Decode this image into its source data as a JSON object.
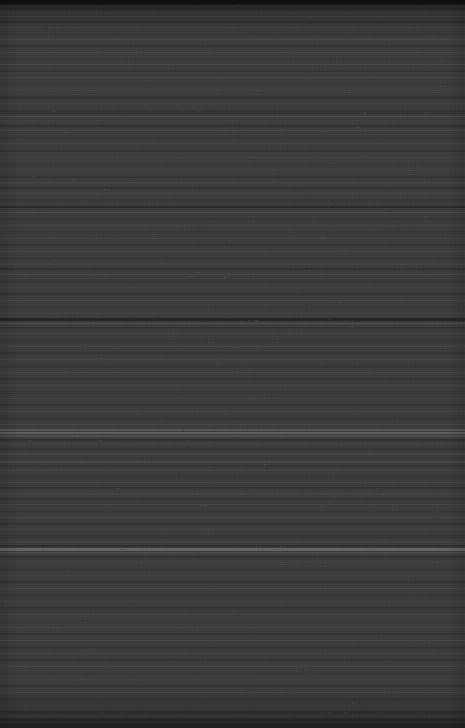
{
  "capture": {
    "width": 465,
    "height": 728,
    "orientation": "portrait",
    "content_state": "no-legible-content",
    "description": "Dark charcoal screen capture with horizontal scanline banding and no discernible user interface elements, text, or icons.",
    "base_color": "#3a3a3a",
    "darkest_color": "#1e1e1e",
    "brightest_color": "#6a6a6a",
    "top_bar_color": "#161616",
    "top_bar_height": 4,
    "artifact_type": "horizontal-banding-noise"
  },
  "bands": [
    {
      "top": 0,
      "height": 5,
      "color": "#1a1a1a",
      "opacity": 1.0
    },
    {
      "top": 5,
      "height": 3,
      "color": "#343434",
      "opacity": 1.0
    },
    {
      "top": 8,
      "height": 2,
      "color": "#2b2b2b",
      "opacity": 0.9
    },
    {
      "top": 12,
      "height": 2,
      "color": "#444444",
      "opacity": 0.7
    },
    {
      "top": 16,
      "height": 1,
      "color": "#4e4e4e",
      "opacity": 0.65
    },
    {
      "top": 21,
      "height": 2,
      "color": "#2c2c2c",
      "opacity": 0.8
    },
    {
      "top": 27,
      "height": 1,
      "color": "#4a4a4a",
      "opacity": 0.55
    },
    {
      "top": 33,
      "height": 3,
      "color": "#333333",
      "opacity": 0.75
    },
    {
      "top": 39,
      "height": 1,
      "color": "#505050",
      "opacity": 0.6
    },
    {
      "top": 45,
      "height": 2,
      "color": "#2e2e2e",
      "opacity": 0.7
    },
    {
      "top": 52,
      "height": 1,
      "color": "#4c4c4c",
      "opacity": 0.5
    },
    {
      "top": 58,
      "height": 3,
      "color": "#353535",
      "opacity": 0.7
    },
    {
      "top": 64,
      "height": 1,
      "color": "#4f4f4f",
      "opacity": 0.55
    },
    {
      "top": 70,
      "height": 2,
      "color": "#2f2f2f",
      "opacity": 0.7
    },
    {
      "top": 77,
      "height": 1,
      "color": "#515151",
      "opacity": 0.55
    },
    {
      "top": 83,
      "height": 2,
      "color": "#343434",
      "opacity": 0.7
    },
    {
      "top": 90,
      "height": 1,
      "color": "#4b4b4b",
      "opacity": 0.5
    },
    {
      "top": 96,
      "height": 3,
      "color": "#2d2d2d",
      "opacity": 0.72
    },
    {
      "top": 103,
      "height": 1,
      "color": "#4d4d4d",
      "opacity": 0.55
    },
    {
      "top": 110,
      "height": 4,
      "color": "#313131",
      "opacity": 0.78
    },
    {
      "top": 116,
      "height": 1,
      "color": "#555555",
      "opacity": 0.62
    },
    {
      "top": 120,
      "height": 2,
      "color": "#3f3f3f",
      "opacity": 0.6
    },
    {
      "top": 125,
      "height": 2,
      "color": "#2a2a2a",
      "opacity": 0.8
    },
    {
      "top": 130,
      "height": 1,
      "color": "#4e4e4e",
      "opacity": 0.55
    },
    {
      "top": 136,
      "height": 3,
      "color": "#333333",
      "opacity": 0.7
    },
    {
      "top": 143,
      "height": 1,
      "color": "#505050",
      "opacity": 0.55
    },
    {
      "top": 150,
      "height": 2,
      "color": "#2e2e2e",
      "opacity": 0.72
    },
    {
      "top": 157,
      "height": 1,
      "color": "#4c4c4c",
      "opacity": 0.5
    },
    {
      "top": 163,
      "height": 3,
      "color": "#363636",
      "opacity": 0.68
    },
    {
      "top": 170,
      "height": 1,
      "color": "#4a4a4a",
      "opacity": 0.52
    },
    {
      "top": 176,
      "height": 2,
      "color": "#2c2c2c",
      "opacity": 0.74
    },
    {
      "top": 182,
      "height": 2,
      "color": "#474747",
      "opacity": 0.58
    },
    {
      "top": 187,
      "height": 2,
      "color": "#2b2b2b",
      "opacity": 0.8
    },
    {
      "top": 193,
      "height": 1,
      "color": "#4f4f4f",
      "opacity": 0.55
    },
    {
      "top": 199,
      "height": 3,
      "color": "#333333",
      "opacity": 0.7
    },
    {
      "top": 206,
      "height": 2,
      "color": "#252525",
      "opacity": 0.85
    },
    {
      "top": 212,
      "height": 1,
      "color": "#565656",
      "opacity": 0.6
    },
    {
      "top": 218,
      "height": 2,
      "color": "#303030",
      "opacity": 0.72
    },
    {
      "top": 225,
      "height": 1,
      "color": "#4b4b4b",
      "opacity": 0.5
    },
    {
      "top": 231,
      "height": 3,
      "color": "#353535",
      "opacity": 0.68
    },
    {
      "top": 238,
      "height": 1,
      "color": "#4e4e4e",
      "opacity": 0.52
    },
    {
      "top": 244,
      "height": 2,
      "color": "#2d2d2d",
      "opacity": 0.74
    },
    {
      "top": 251,
      "height": 1,
      "color": "#4d4d4d",
      "opacity": 0.5
    },
    {
      "top": 257,
      "height": 3,
      "color": "#343434",
      "opacity": 0.68
    },
    {
      "top": 263,
      "height": 2,
      "color": "#484848",
      "opacity": 0.55
    },
    {
      "top": 268,
      "height": 2,
      "color": "#2a2a2a",
      "opacity": 0.78
    },
    {
      "top": 274,
      "height": 1,
      "color": "#515151",
      "opacity": 0.55
    },
    {
      "top": 280,
      "height": 3,
      "color": "#323232",
      "opacity": 0.7
    },
    {
      "top": 287,
      "height": 1,
      "color": "#4c4c4c",
      "opacity": 0.5
    },
    {
      "top": 293,
      "height": 2,
      "color": "#2e2e2e",
      "opacity": 0.72
    },
    {
      "top": 300,
      "height": 1,
      "color": "#4f4f4f",
      "opacity": 0.52
    },
    {
      "top": 306,
      "height": 3,
      "color": "#363636",
      "opacity": 0.66
    },
    {
      "top": 313,
      "height": 1,
      "color": "#4a4a4a",
      "opacity": 0.5
    },
    {
      "top": 318,
      "height": 3,
      "color": "#1f1f1f",
      "opacity": 0.92
    },
    {
      "top": 323,
      "height": 1,
      "color": "#5a5a5a",
      "opacity": 0.62
    },
    {
      "top": 327,
      "height": 2,
      "color": "#2f2f2f",
      "opacity": 0.74
    },
    {
      "top": 333,
      "height": 1,
      "color": "#4e4e4e",
      "opacity": 0.52
    },
    {
      "top": 339,
      "height": 3,
      "color": "#343434",
      "opacity": 0.68
    },
    {
      "top": 346,
      "height": 1,
      "color": "#4d4d4d",
      "opacity": 0.5
    },
    {
      "top": 352,
      "height": 2,
      "color": "#2c2c2c",
      "opacity": 0.74
    },
    {
      "top": 359,
      "height": 1,
      "color": "#505050",
      "opacity": 0.54
    },
    {
      "top": 365,
      "height": 3,
      "color": "#333333",
      "opacity": 0.68
    },
    {
      "top": 372,
      "height": 1,
      "color": "#4b4b4b",
      "opacity": 0.5
    },
    {
      "top": 378,
      "height": 2,
      "color": "#2e2e2e",
      "opacity": 0.72
    },
    {
      "top": 385,
      "height": 1,
      "color": "#4f4f4f",
      "opacity": 0.52
    },
    {
      "top": 391,
      "height": 3,
      "color": "#353535",
      "opacity": 0.66
    },
    {
      "top": 398,
      "height": 1,
      "color": "#4c4c4c",
      "opacity": 0.5
    },
    {
      "top": 404,
      "height": 2,
      "color": "#2d2d2d",
      "opacity": 0.72
    },
    {
      "top": 411,
      "height": 1,
      "color": "#4e4e4e",
      "opacity": 0.52
    },
    {
      "top": 417,
      "height": 3,
      "color": "#323232",
      "opacity": 0.7
    },
    {
      "top": 424,
      "height": 1,
      "color": "#4a4a4a",
      "opacity": 0.5
    },
    {
      "top": 429,
      "height": 2,
      "color": "#5e5e5e",
      "opacity": 0.72
    },
    {
      "top": 432,
      "height": 2,
      "color": "#676767",
      "opacity": 0.78
    },
    {
      "top": 435,
      "height": 2,
      "color": "#585858",
      "opacity": 0.66
    },
    {
      "top": 439,
      "height": 2,
      "color": "#2b2b2b",
      "opacity": 0.8
    },
    {
      "top": 443,
      "height": 2,
      "color": "#414141",
      "opacity": 0.58
    },
    {
      "top": 448,
      "height": 2,
      "color": "#2d2d2d",
      "opacity": 0.74
    },
    {
      "top": 453,
      "height": 2,
      "color": "#4a4a4a",
      "opacity": 0.58
    },
    {
      "top": 457,
      "height": 2,
      "color": "#343434",
      "opacity": 0.68
    },
    {
      "top": 461,
      "height": 2,
      "color": "#4e4e4e",
      "opacity": 0.6
    },
    {
      "top": 465,
      "height": 2,
      "color": "#2f2f2f",
      "opacity": 0.74
    },
    {
      "top": 470,
      "height": 1,
      "color": "#505050",
      "opacity": 0.55
    },
    {
      "top": 475,
      "height": 3,
      "color": "#333333",
      "opacity": 0.68
    },
    {
      "top": 482,
      "height": 1,
      "color": "#4c4c4c",
      "opacity": 0.5
    },
    {
      "top": 487,
      "height": 2,
      "color": "#2c2c2c",
      "opacity": 0.74
    },
    {
      "top": 493,
      "height": 2,
      "color": "#484848",
      "opacity": 0.56
    },
    {
      "top": 498,
      "height": 2,
      "color": "#2e2e2e",
      "opacity": 0.72
    },
    {
      "top": 504,
      "height": 1,
      "color": "#4f4f4f",
      "opacity": 0.52
    },
    {
      "top": 510,
      "height": 3,
      "color": "#353535",
      "opacity": 0.66
    },
    {
      "top": 517,
      "height": 1,
      "color": "#4b4b4b",
      "opacity": 0.5
    },
    {
      "top": 523,
      "height": 2,
      "color": "#2d2d2d",
      "opacity": 0.72
    },
    {
      "top": 529,
      "height": 1,
      "color": "#4e4e4e",
      "opacity": 0.52
    },
    {
      "top": 535,
      "height": 3,
      "color": "#323232",
      "opacity": 0.7
    },
    {
      "top": 541,
      "height": 2,
      "color": "#444444",
      "opacity": 0.55
    },
    {
      "top": 545,
      "height": 2,
      "color": "#292929",
      "opacity": 0.8
    },
    {
      "top": 548,
      "height": 3,
      "color": "#6a6a6a",
      "opacity": 0.85
    },
    {
      "top": 552,
      "height": 2,
      "color": "#4e4e4e",
      "opacity": 0.6
    },
    {
      "top": 556,
      "height": 2,
      "color": "#2c2c2c",
      "opacity": 0.76
    },
    {
      "top": 562,
      "height": 1,
      "color": "#4a4a4a",
      "opacity": 0.5
    },
    {
      "top": 568,
      "height": 3,
      "color": "#343434",
      "opacity": 0.66
    },
    {
      "top": 575,
      "height": 1,
      "color": "#4d4d4d",
      "opacity": 0.5
    },
    {
      "top": 581,
      "height": 2,
      "color": "#2e2e2e",
      "opacity": 0.72
    },
    {
      "top": 588,
      "height": 1,
      "color": "#4f4f4f",
      "opacity": 0.52
    },
    {
      "top": 594,
      "height": 3,
      "color": "#333333",
      "opacity": 0.66
    },
    {
      "top": 601,
      "height": 1,
      "color": "#4b4b4b",
      "opacity": 0.48
    },
    {
      "top": 607,
      "height": 2,
      "color": "#2d2d2d",
      "opacity": 0.72
    },
    {
      "top": 614,
      "height": 1,
      "color": "#4e4e4e",
      "opacity": 0.5
    },
    {
      "top": 620,
      "height": 3,
      "color": "#353535",
      "opacity": 0.64
    },
    {
      "top": 627,
      "height": 1,
      "color": "#4c4c4c",
      "opacity": 0.5
    },
    {
      "top": 633,
      "height": 2,
      "color": "#2c2c2c",
      "opacity": 0.72
    },
    {
      "top": 640,
      "height": 1,
      "color": "#505050",
      "opacity": 0.52
    },
    {
      "top": 646,
      "height": 3,
      "color": "#323232",
      "opacity": 0.68
    },
    {
      "top": 653,
      "height": 1,
      "color": "#4a4a4a",
      "opacity": 0.48
    },
    {
      "top": 659,
      "height": 2,
      "color": "#2e2e2e",
      "opacity": 0.72
    },
    {
      "top": 666,
      "height": 1,
      "color": "#4d4d4d",
      "opacity": 0.5
    },
    {
      "top": 672,
      "height": 3,
      "color": "#343434",
      "opacity": 0.64
    },
    {
      "top": 679,
      "height": 1,
      "color": "#4b4b4b",
      "opacity": 0.48
    },
    {
      "top": 685,
      "height": 2,
      "color": "#2d2d2d",
      "opacity": 0.72
    },
    {
      "top": 692,
      "height": 1,
      "color": "#4e4e4e",
      "opacity": 0.5
    },
    {
      "top": 698,
      "height": 3,
      "color": "#313131",
      "opacity": 0.7
    },
    {
      "top": 705,
      "height": 1,
      "color": "#484848",
      "opacity": 0.48
    },
    {
      "top": 711,
      "height": 3,
      "color": "#2b2b2b",
      "opacity": 0.76
    },
    {
      "top": 718,
      "height": 4,
      "color": "#282828",
      "opacity": 0.8
    },
    {
      "top": 723,
      "height": 5,
      "color": "#242424",
      "opacity": 0.85
    }
  ],
  "speckle": {
    "count": 900,
    "light_color": "#7a7a7a",
    "dark_color": "#141414",
    "dense_rows": [
      9,
      27,
      111,
      127,
      207,
      268,
      319,
      320,
      321,
      430,
      440,
      446,
      494,
      546,
      549,
      712
    ]
  }
}
